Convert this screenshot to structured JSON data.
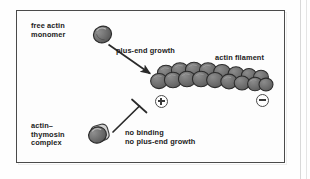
{
  "figure": {
    "type": "biology-schematic",
    "background_color": "#fdfdfd",
    "frame_color": "#4a4a4a",
    "subunit_color": "#6b6b6b",
    "subunit_outline": "#2e2e2e",
    "text_color": "#1b1b1b"
  },
  "labels": {
    "free_monomer": "free actin\nmonomer",
    "plus_end_growth": "plus-end growth",
    "actin_filament": "actin filament",
    "complex": "actin–\nthymosin\ncomplex",
    "no_binding": "no binding\nno plus-end growth"
  },
  "polarity": {
    "plus_end": "+",
    "minus_end": "−"
  },
  "elements": {
    "monomer_icon": "actin-monomer-oval",
    "complex_icon": "actin-thymosin-complex",
    "growth_arrow": "arrow-down-right",
    "inhibition_bar": "t-bar-inhibition",
    "filament": "actin-filament-double-helix-chain"
  }
}
